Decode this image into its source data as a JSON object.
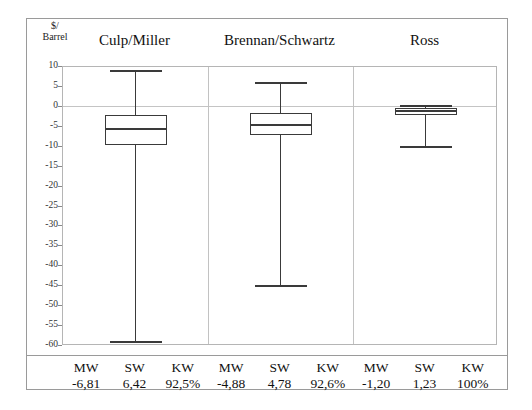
{
  "chart_data": {
    "type": "box",
    "title": "",
    "ylabel_line1": "$/",
    "ylabel_line2": "Barrel",
    "ylim": [
      -60,
      10
    ],
    "ytick_step": 5,
    "yticks": [
      10,
      5,
      0,
      -5,
      -10,
      -15,
      -20,
      -25,
      -30,
      -35,
      -40,
      -45,
      -50,
      -55,
      -60
    ],
    "ytick_labels": [
      "10",
      "5",
      "0",
      "-5",
      "-10",
      "-15",
      "-20",
      "-25",
      "-30",
      "-35",
      "-40",
      "-45",
      "-50",
      "-55",
      "-60"
    ],
    "grid": "horizontal-faint",
    "legend": "none",
    "groups": [
      "Culp/Miller",
      "Brennan/Schwartz",
      "Ross"
    ],
    "boxes": [
      {
        "group": "Culp/Miller",
        "whisker_low": -59.0,
        "q1": -9.5,
        "median": -5.5,
        "q3": -2.0,
        "whisker_high": 9.0
      },
      {
        "group": "Brennan/Schwartz",
        "whisker_low": -45.0,
        "q1": -7.0,
        "median": -4.5,
        "q3": -1.5,
        "whisker_high": 6.0
      },
      {
        "group": "Ross",
        "whisker_low": -10.0,
        "q1": -2.0,
        "median": -1.0,
        "q3": -0.2,
        "whisker_high": 0.3
      }
    ]
  },
  "stats_table": {
    "columns": [
      "MW",
      "SW",
      "KW"
    ],
    "rows": [
      {
        "group": "Culp/Miller",
        "MW": "-6,81",
        "SW": "6,42",
        "KW": "92,5%"
      },
      {
        "group": "Brennan/Schwartz",
        "MW": "-4,88",
        "SW": "4,78",
        "KW": "92,6%"
      },
      {
        "group": "Ross",
        "MW": "-1,20",
        "SW": "1,23",
        "KW": "100%"
      }
    ],
    "cells": [
      {
        "name": "MW",
        "value": "-6,81"
      },
      {
        "name": "SW",
        "value": "6,42"
      },
      {
        "name": "KW",
        "value": "92,5%"
      },
      {
        "name": "MW",
        "value": "-4,88"
      },
      {
        "name": "SW",
        "value": "4,78"
      },
      {
        "name": "KW",
        "value": "92,6%"
      },
      {
        "name": "MW",
        "value": "-1,20"
      },
      {
        "name": "SW",
        "value": "1,23"
      },
      {
        "name": "KW",
        "value": "100%"
      }
    ]
  },
  "colors": {
    "frame": "#9a9a9a",
    "plot_border": "#b5b5b5",
    "gridline": "#d0d0d0",
    "box_stroke": "#3a3a3a",
    "box_fill": "#ffffff",
    "text": "#111111",
    "background": "#ffffff"
  }
}
